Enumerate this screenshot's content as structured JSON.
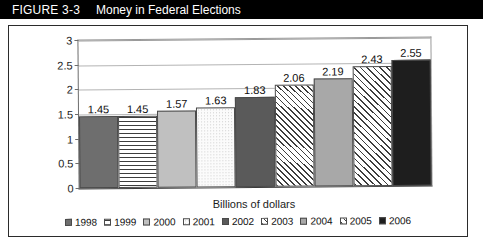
{
  "header": {
    "figure_number": "FIGURE 3-3",
    "title": "Money in Federal Elections"
  },
  "chart_data": {
    "type": "bar",
    "title": "Money in Federal Elections",
    "xlabel": "Billions of dollars",
    "ylabel": "",
    "categories": [
      "1998",
      "1999",
      "2000",
      "2001",
      "2002",
      "2003",
      "2004",
      "2005",
      "2006"
    ],
    "values": [
      1.45,
      1.45,
      1.57,
      1.63,
      1.83,
      2.06,
      2.19,
      2.43,
      2.55
    ],
    "data_labels": [
      "1.45",
      "1.45",
      "1.57",
      "1.63",
      "1.83",
      "2.06",
      "2.19",
      "2.43",
      "2.55"
    ],
    "ylim": [
      0,
      3
    ],
    "ytick_labels": [
      "3",
      "2.5",
      "2",
      "1.5",
      "1",
      "0.5",
      "0"
    ],
    "ytick_values": [
      3,
      2.5,
      2,
      1.5,
      1,
      0.5,
      0
    ],
    "grid": true,
    "legend_position": "bottom",
    "series": [
      {
        "name": "Billions of dollars",
        "values": [
          1.45,
          1.45,
          1.57,
          1.63,
          1.83,
          2.06,
          2.19,
          2.43,
          2.55
        ]
      }
    ],
    "bar_fills": [
      "solid-dark-gray",
      "horizontal-lines",
      "solid-light-gray",
      "dotted-white",
      "solid-dark-gray",
      "diagonal-hatch",
      "solid-medium-gray",
      "diagonal-hatch",
      "solid-black"
    ]
  },
  "legend": {
    "items": [
      {
        "label": "1998",
        "fill": "solid-dark-gray"
      },
      {
        "label": "1999",
        "fill": "horizontal-lines"
      },
      {
        "label": "2000",
        "fill": "solid-light-gray"
      },
      {
        "label": "2001",
        "fill": "dotted-white"
      },
      {
        "label": "2002",
        "fill": "solid-dark-gray"
      },
      {
        "label": "2003",
        "fill": "diagonal-hatch"
      },
      {
        "label": "2004",
        "fill": "solid-medium-gray"
      },
      {
        "label": "2005",
        "fill": "diagonal-hatch"
      },
      {
        "label": "2006",
        "fill": "solid-black"
      }
    ]
  },
  "colors": {
    "header_background": "#000000",
    "header_text": "#ffffff",
    "frame_border": "#2b2b2b",
    "gridline": "#b4b4b4",
    "plot_background": "#ffffff"
  }
}
